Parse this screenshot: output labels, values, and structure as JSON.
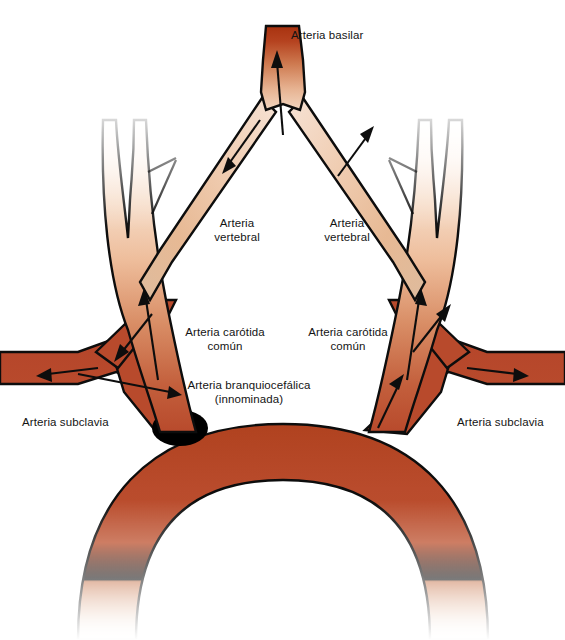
{
  "figure": {
    "background_color": "#ffffff",
    "outline_color": "#0d0d0d",
    "arrow_color": "#0d0d0d",
    "colors": {
      "aorta_red": "#b84a2c",
      "aorta_red_dark": "#a8401f",
      "vessel_mid": "#cf7a52",
      "vessel_light": "#eec3a4",
      "vessel_pale": "#f6ded0",
      "basilar_top": "#b03518",
      "shadow_black": "#000000"
    }
  },
  "labels": {
    "basilar": {
      "text": "Arteria basilar",
      "x": 291,
      "y": 28
    },
    "vertebral_left": {
      "text": "Arteria\nvertebral",
      "x": 205,
      "y": 216
    },
    "vertebral_right": {
      "text": "Arteria\nvertebral",
      "x": 315,
      "y": 216
    },
    "carotid_left": {
      "text": "Arteria carótida\ncomún",
      "x": 182,
      "y": 325
    },
    "carotid_right": {
      "text": "Arteria carótida\ncomún",
      "x": 305,
      "y": 325
    },
    "brachiocephalic": {
      "text": "Arteria branquiocefálica\n(innominada)",
      "x": 180,
      "y": 378
    },
    "subclavian_left": {
      "text": "Arteria subclavia",
      "x": 22,
      "y": 415
    },
    "subclavian_right": {
      "text": "Arteria subclavia",
      "x": 457,
      "y": 415
    }
  },
  "arrows": [
    {
      "name": "basilar-up",
      "direction": "up"
    },
    {
      "name": "vertebral-left-down",
      "direction": "down-left"
    },
    {
      "name": "vertebral-right-down",
      "direction": "down-right"
    },
    {
      "name": "carotid-left-up",
      "direction": "up"
    },
    {
      "name": "carotid-right-up",
      "direction": "up"
    },
    {
      "name": "subclavian-left-out",
      "direction": "left"
    },
    {
      "name": "subclavian-right-out",
      "direction": "right"
    },
    {
      "name": "brachiocephalic-left-up",
      "direction": "up-left"
    },
    {
      "name": "brachiocephalic-right-up",
      "direction": "up-right"
    },
    {
      "name": "aorta-left-out",
      "direction": "left"
    },
    {
      "name": "aorta-right-up",
      "direction": "up-right"
    }
  ]
}
